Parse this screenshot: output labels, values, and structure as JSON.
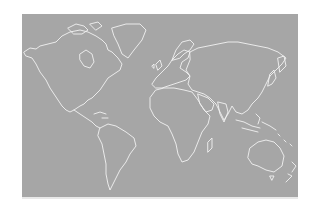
{
  "map": {
    "type": "world-outline",
    "projection": "equirectangular-like",
    "background_color": "#a6a6a6",
    "coastline_color": "#f2f2f2",
    "page_color": "#ffffff",
    "continents": [
      "North America",
      "Greenland",
      "South America",
      "Europe",
      "Africa",
      "Asia",
      "Australia",
      "New Zealand",
      "Antarctica-excluded"
    ]
  }
}
